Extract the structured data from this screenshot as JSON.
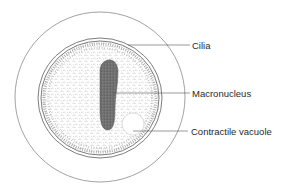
{
  "diagram": {
    "colors": {
      "outline": "#7a7a7a",
      "cytoplasm_stipple": "#9a9a9a",
      "nucleus": "#6e6e6e",
      "text": "#2a2a2a",
      "background": "#ffffff"
    },
    "labels": [
      {
        "id": "cilia",
        "text": "Cilia"
      },
      {
        "id": "macronucleus",
        "text": "Macronucleus"
      },
      {
        "id": "contractile-vacuole",
        "text": "Contractile vacuole"
      }
    ]
  }
}
